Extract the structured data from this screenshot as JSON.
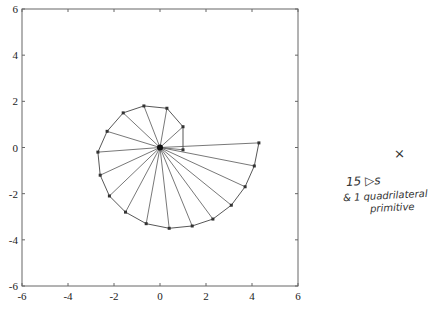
{
  "chart_data": {
    "type": "line",
    "title": "",
    "xlabel": "",
    "ylabel": "",
    "xlim": [
      -6,
      6
    ],
    "ylim": [
      -6,
      6
    ],
    "grid": false,
    "legend": null,
    "x_ticks": [
      -6,
      -4,
      -2,
      0,
      2,
      4,
      6
    ],
    "y_ticks": [
      -6,
      -4,
      -2,
      0,
      2,
      4,
      6
    ],
    "x_tick_labels": [
      "-6",
      "-4",
      "-2",
      "0",
      "2",
      "4",
      "6"
    ],
    "y_tick_labels": [
      "-6",
      "-4",
      "-2",
      "0",
      "2",
      "4",
      "6"
    ],
    "center": [
      0,
      0
    ],
    "spiral_vertices": [
      [
        1.0,
        -0.1
      ],
      [
        1.0,
        0.9
      ],
      [
        0.3,
        1.7
      ],
      [
        -0.7,
        1.8
      ],
      [
        -1.6,
        1.5
      ],
      [
        -2.3,
        0.7
      ],
      [
        -2.7,
        -0.2
      ],
      [
        -2.6,
        -1.2
      ],
      [
        -2.2,
        -2.1
      ],
      [
        -1.5,
        -2.8
      ],
      [
        -0.6,
        -3.3
      ],
      [
        0.4,
        -3.5
      ],
      [
        1.4,
        -3.4
      ],
      [
        2.3,
        -3.1
      ],
      [
        3.1,
        -2.5
      ],
      [
        3.7,
        -1.7
      ],
      [
        4.1,
        -0.8
      ],
      [
        4.3,
        0.2
      ]
    ],
    "quadrilateral": [
      [
        0,
        0
      ],
      [
        1.0,
        0
      ],
      [
        1.0,
        -0.1
      ],
      [
        4.3,
        0.2
      ]
    ],
    "annotation": [
      "x",
      "15 ▷s",
      "& 1 quadrilateral",
      "primitive"
    ]
  },
  "annotation": {
    "mark": "×",
    "line1": "15 ▷s",
    "line2": "& 1 quadrilateral",
    "line3": "primitive"
  }
}
